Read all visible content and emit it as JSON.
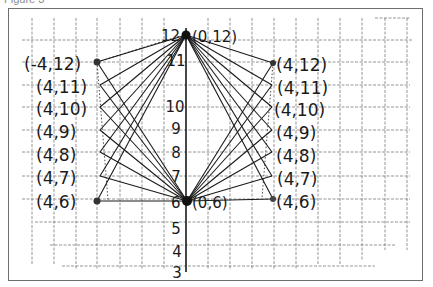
{
  "figure": {
    "caption": "Figure 3"
  },
  "axis": {
    "orientation": "vertical",
    "tick_labels": [
      "12",
      "11",
      "10",
      "9",
      "8",
      "7",
      "6",
      "5",
      "4",
      "3"
    ]
  },
  "points": {
    "center_top": {
      "label": "(0,12)",
      "x": 0,
      "y": 12
    },
    "center_bottom": {
      "label": "(0,6)",
      "x": 0,
      "y": 6
    },
    "left_top": {
      "label": "(-4,12)",
      "x": -4,
      "y": 12
    },
    "left_bottom": {
      "label": "(-4,6)",
      "x": -4,
      "y": 6
    },
    "right_top": {
      "label": "(4,12)",
      "x": 4,
      "y": 12
    },
    "right_bottom": {
      "label": "(4,6)",
      "x": 4,
      "y": 6
    }
  },
  "left_labels": [
    "(-4,12)",
    "(4,11)",
    "(4,10)",
    "(4,9)",
    "(4,8)",
    "(4,7)",
    "(4,6)"
  ],
  "right_labels": [
    "(4,12)",
    "(4,11)",
    "(4,10)",
    "(4,9)",
    "(4,8)",
    "(4,7)",
    "(4,6)"
  ],
  "center_labels": {
    "top_tick": "12",
    "top_point": "(0,12)",
    "bottom_tick": "6",
    "bottom_point": "(0,6)"
  },
  "colors": {
    "ink": "#1a1a1a",
    "grid": "#7a7a7a",
    "frame": "#6e6e6e"
  }
}
